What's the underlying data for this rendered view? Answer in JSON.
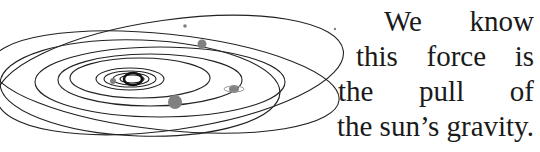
{
  "paragraph": {
    "lines": [
      "We know",
      "this force is",
      "the pull of",
      "the sun’s gravity."
    ]
  },
  "figure": {
    "orbit_color": "#222222",
    "planet_color": "#808080"
  }
}
